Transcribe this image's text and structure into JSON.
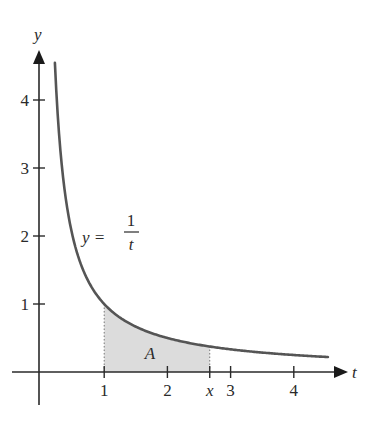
{
  "chart_data": {
    "type": "line",
    "title": "",
    "function_label": {
      "lhs": "y =",
      "numerator": "1",
      "denominator": "t"
    },
    "xlabel": "t",
    "ylabel": "y",
    "x_ticks": [
      {
        "value": 1,
        "label": "1"
      },
      {
        "value": 2,
        "label": "2"
      },
      {
        "value": 2.67,
        "label": "x",
        "italic": true
      },
      {
        "value": 3,
        "label": "3"
      },
      {
        "value": 4,
        "label": "4"
      }
    ],
    "y_ticks": [
      {
        "value": 1,
        "label": "1"
      },
      {
        "value": 2,
        "label": "2"
      },
      {
        "value": 3,
        "label": "3"
      },
      {
        "value": 4,
        "label": "4"
      }
    ],
    "curve": {
      "expression": "y = 1/t",
      "t_min": 0.22,
      "t_max": 4.54
    },
    "shaded_region": {
      "label": "A",
      "t_from": 1,
      "t_to": 2.67,
      "fill": "#dcdcdc"
    },
    "colors": {
      "axis": "#2a2a2a",
      "curve": "#555555",
      "shade": "#dcdcdc",
      "guide": "#777777"
    },
    "grid": false,
    "legend": null
  }
}
